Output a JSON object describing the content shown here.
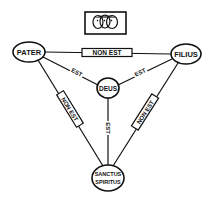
{
  "diagram": {
    "title_emblem": {
      "icon": "three-faces-icon",
      "description": "Three conjoined heads emblem"
    },
    "nodes": {
      "pater": {
        "label": "PATER",
        "cx": 29,
        "cy": 52,
        "rx": 16,
        "ry": 10
      },
      "filius": {
        "label": "FILIUS",
        "cx": 186,
        "cy": 54,
        "rx": 15,
        "ry": 10
      },
      "deus": {
        "label": "DEUS",
        "cx": 108,
        "cy": 88,
        "rx": 11,
        "ry": 10
      },
      "spiritus": {
        "label_line1": "SANCTUS",
        "label_line2": "SPIRITUS",
        "cx": 108,
        "cy": 178,
        "rx": 16,
        "ry": 13
      }
    },
    "edges": {
      "pater_filius": {
        "label": "NON EST",
        "boxed": true
      },
      "pater_spiritus": {
        "label": "NON EST",
        "boxed": true
      },
      "filius_spiritus": {
        "label": "NON EST",
        "boxed": true
      },
      "pater_deus": {
        "label": "EST",
        "boxed": false
      },
      "filius_deus": {
        "label": "EST",
        "boxed": false
      },
      "deus_spiritus": {
        "label": "EST",
        "boxed": false
      }
    },
    "colors": {
      "ink": "#111111",
      "background": "#ffffff"
    }
  }
}
